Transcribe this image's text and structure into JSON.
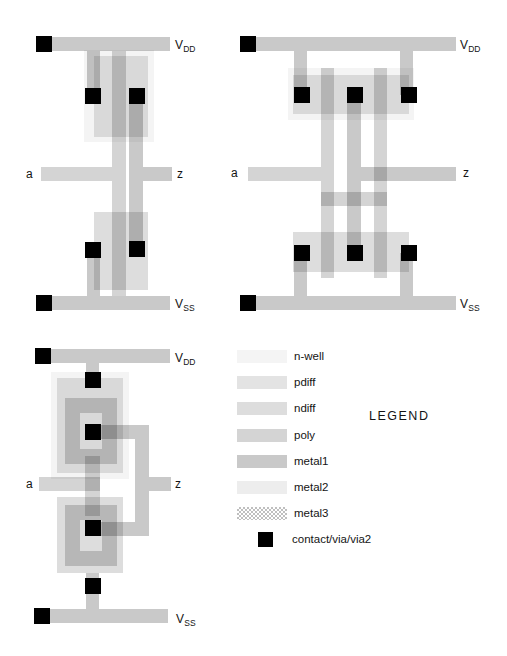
{
  "canvas": {
    "width": 507,
    "height": 656,
    "background": "#ffffff"
  },
  "layers": {
    "nwell": {
      "label": "n-well",
      "color": "rgba(0,0,0,0.045)"
    },
    "pdiff": {
      "label": "pdiff",
      "color": "rgba(0,0,0,0.11)"
    },
    "ndiff": {
      "label": "ndiff",
      "color": "rgba(0,0,0,0.135)"
    },
    "poly": {
      "label": "poly",
      "color": "rgba(0,0,0,0.17)"
    },
    "metal1": {
      "label": "metal1",
      "color": "rgba(0,0,0,0.21)"
    },
    "metal2": {
      "label": "metal2",
      "color": "rgba(0,0,0,0.07)"
    },
    "metal3": {
      "label": "metal3",
      "color": "rgba(0,0,0,0.25)",
      "pattern": "checker"
    },
    "contact": {
      "label": "contact/via/via2",
      "color": "#000000"
    }
  },
  "legend": {
    "title": "LEGEND",
    "order": [
      "nwell",
      "pdiff",
      "ndiff",
      "poly",
      "metal1",
      "metal2",
      "metal3",
      "contact"
    ]
  },
  "diagrams": [
    {
      "name": "inverter-strip-layout",
      "labels": [
        {
          "text": "V",
          "sub": "DD",
          "x": 175,
          "y": 39
        },
        {
          "text": "a",
          "x": 26,
          "y": 168
        },
        {
          "text": "z",
          "x": 177,
          "y": 168
        },
        {
          "text": "V",
          "sub": "SS",
          "x": 175,
          "y": 298
        }
      ],
      "shapes": [
        {
          "name": "n-well-region",
          "layer": "nwell",
          "x": 84,
          "y": 50,
          "w": 70,
          "h": 92
        },
        {
          "name": "pdiff-region",
          "layer": "pdiff",
          "x": 94,
          "y": 56,
          "w": 54,
          "h": 81
        },
        {
          "name": "ndiff-region",
          "layer": "ndiff",
          "x": 94,
          "y": 212,
          "w": 54,
          "h": 78
        },
        {
          "name": "poly-gate-column",
          "layer": "poly",
          "x": 112,
          "y": 51,
          "w": 14,
          "h": 245
        },
        {
          "name": "input-a-poly-bar",
          "layer": "poly",
          "x": 41,
          "y": 167,
          "w": 71,
          "h": 14
        },
        {
          "name": "vdd-rail",
          "layer": "metal1",
          "x": 36,
          "y": 37,
          "w": 134,
          "h": 14
        },
        {
          "name": "vdd-source-stub",
          "layer": "metal1",
          "x": 87,
          "y": 51,
          "w": 13,
          "h": 44
        },
        {
          "name": "drain-metal-column",
          "layer": "metal1",
          "x": 129,
          "y": 95,
          "w": 14,
          "h": 154
        },
        {
          "name": "output-z-metal-bar",
          "layer": "metal1",
          "x": 143,
          "y": 167,
          "w": 29,
          "h": 14
        },
        {
          "name": "vss-source-stub",
          "layer": "metal1",
          "x": 87,
          "y": 250,
          "w": 13,
          "h": 46
        },
        {
          "name": "vss-rail",
          "layer": "metal1",
          "x": 36,
          "y": 296,
          "w": 134,
          "h": 14
        },
        {
          "name": "vdd-rail-contact",
          "layer": "contact",
          "x": 36,
          "y": 36,
          "w": 16,
          "h": 16
        },
        {
          "name": "pmos-source-contact",
          "layer": "contact",
          "x": 85,
          "y": 88,
          "w": 16,
          "h": 16
        },
        {
          "name": "pmos-drain-contact",
          "layer": "contact",
          "x": 129,
          "y": 88,
          "w": 16,
          "h": 16
        },
        {
          "name": "nmos-source-contact",
          "layer": "contact",
          "x": 85,
          "y": 242,
          "w": 16,
          "h": 16
        },
        {
          "name": "nmos-drain-contact",
          "layer": "contact",
          "x": 129,
          "y": 241,
          "w": 16,
          "h": 16
        },
        {
          "name": "vss-rail-contact",
          "layer": "contact",
          "x": 36,
          "y": 295,
          "w": 16,
          "h": 16
        }
      ]
    },
    {
      "name": "inverter-two-finger-layout",
      "labels": [
        {
          "text": "V",
          "sub": "DD",
          "x": 460,
          "y": 39
        },
        {
          "text": "a",
          "x": 231,
          "y": 167
        },
        {
          "text": "z",
          "x": 463,
          "y": 167
        },
        {
          "text": "V",
          "sub": "SS",
          "x": 460,
          "y": 298
        }
      ],
      "shapes": [
        {
          "name": "n-well-region",
          "layer": "nwell",
          "x": 288,
          "y": 68,
          "w": 126,
          "h": 52
        },
        {
          "name": "pdiff-band",
          "layer": "pdiff",
          "x": 293,
          "y": 75,
          "w": 116,
          "h": 39
        },
        {
          "name": "ndiff-band",
          "layer": "ndiff",
          "x": 293,
          "y": 232,
          "w": 116,
          "h": 40
        },
        {
          "name": "poly-gate-column-left",
          "layer": "poly",
          "x": 321,
          "y": 68,
          "w": 13,
          "h": 210
        },
        {
          "name": "poly-gate-column-right",
          "layer": "poly",
          "x": 374,
          "y": 68,
          "w": 13,
          "h": 210
        },
        {
          "name": "poly-gate-link",
          "layer": "poly",
          "x": 321,
          "y": 192,
          "w": 66,
          "h": 14
        },
        {
          "name": "input-a-poly-bar",
          "layer": "poly",
          "x": 248,
          "y": 167,
          "w": 73,
          "h": 14
        },
        {
          "name": "vdd-rail",
          "layer": "metal1",
          "x": 241,
          "y": 37,
          "w": 215,
          "h": 14
        },
        {
          "name": "vdd-stub-left",
          "layer": "metal1",
          "x": 294,
          "y": 51,
          "w": 13,
          "h": 44
        },
        {
          "name": "vdd-stub-right",
          "layer": "metal1",
          "x": 400,
          "y": 51,
          "w": 13,
          "h": 44
        },
        {
          "name": "drain-metal-column",
          "layer": "metal1",
          "x": 347,
          "y": 95,
          "w": 14,
          "h": 159
        },
        {
          "name": "output-z-metal-bar",
          "layer": "metal1",
          "x": 361,
          "y": 167,
          "w": 95,
          "h": 14
        },
        {
          "name": "vss-stub-left",
          "layer": "metal1",
          "x": 294,
          "y": 253,
          "w": 13,
          "h": 43
        },
        {
          "name": "vss-stub-right",
          "layer": "metal1",
          "x": 400,
          "y": 253,
          "w": 13,
          "h": 43
        },
        {
          "name": "vss-rail",
          "layer": "metal1",
          "x": 241,
          "y": 296,
          "w": 215,
          "h": 14
        },
        {
          "name": "vdd-rail-contact",
          "layer": "contact",
          "x": 240,
          "y": 36,
          "w": 16,
          "h": 16
        },
        {
          "name": "pmos-source-contact-left",
          "layer": "contact",
          "x": 294,
          "y": 87,
          "w": 16,
          "h": 16
        },
        {
          "name": "pmos-drain-contact",
          "layer": "contact",
          "x": 347,
          "y": 87,
          "w": 16,
          "h": 16
        },
        {
          "name": "pmos-source-contact-right",
          "layer": "contact",
          "x": 401,
          "y": 87,
          "w": 16,
          "h": 16
        },
        {
          "name": "nmos-source-contact-left",
          "layer": "contact",
          "x": 294,
          "y": 245,
          "w": 16,
          "h": 16
        },
        {
          "name": "nmos-drain-contact",
          "layer": "contact",
          "x": 347,
          "y": 245,
          "w": 16,
          "h": 16
        },
        {
          "name": "nmos-source-contact-right",
          "layer": "contact",
          "x": 401,
          "y": 245,
          "w": 16,
          "h": 16
        },
        {
          "name": "vss-rail-contact",
          "layer": "contact",
          "x": 240,
          "y": 295,
          "w": 16,
          "h": 16
        }
      ]
    },
    {
      "name": "inverter-annular-layout",
      "labels": [
        {
          "text": "V",
          "sub": "DD",
          "x": 175,
          "y": 352
        },
        {
          "text": "a",
          "x": 26,
          "y": 478
        },
        {
          "text": "z",
          "x": 175,
          "y": 478
        },
        {
          "text": "V",
          "sub": "SS",
          "x": 176,
          "y": 613
        }
      ],
      "shapes": [
        {
          "name": "n-well-region",
          "layer": "nwell",
          "x": 51,
          "y": 372,
          "w": 78,
          "h": 107
        },
        {
          "name": "pdiff-region",
          "layer": "pdiff",
          "x": 57,
          "y": 378,
          "w": 66,
          "h": 95
        },
        {
          "name": "ndiff-region",
          "layer": "ndiff",
          "x": 57,
          "y": 497,
          "w": 66,
          "h": 76
        },
        {
          "name": "pmos-poly-gate-ring",
          "layer": "poly",
          "x": 65,
          "y": 398,
          "w": 52,
          "h": 66,
          "t": 15
        },
        {
          "name": "nmos-poly-gate-ring",
          "layer": "poly",
          "x": 65,
          "y": 505,
          "w": 52,
          "h": 61,
          "t": 15
        },
        {
          "name": "poly-gate-connector",
          "layer": "poly",
          "x": 85,
          "y": 456,
          "w": 15,
          "h": 60
        },
        {
          "name": "input-a-poly-bar",
          "layer": "poly",
          "x": 39,
          "y": 477,
          "w": 61,
          "h": 14
        },
        {
          "name": "vdd-rail",
          "layer": "metal1",
          "x": 35,
          "y": 349,
          "w": 135,
          "h": 14
        },
        {
          "name": "vdd-stub",
          "layer": "metal1",
          "x": 86,
          "y": 363,
          "w": 13,
          "h": 18
        },
        {
          "name": "drain-wire-top",
          "layer": "metal1",
          "x": 85,
          "y": 425,
          "w": 50,
          "h": 14
        },
        {
          "name": "drain-wire-vertical",
          "layer": "metal1",
          "x": 135,
          "y": 425,
          "w": 14,
          "h": 111
        },
        {
          "name": "drain-wire-bottom",
          "layer": "metal1",
          "x": 85,
          "y": 522,
          "w": 50,
          "h": 14
        },
        {
          "name": "output-z-metal-bar",
          "layer": "metal1",
          "x": 149,
          "y": 477,
          "w": 22,
          "h": 14
        },
        {
          "name": "vss-stub",
          "layer": "metal1",
          "x": 86,
          "y": 573,
          "w": 13,
          "h": 36
        },
        {
          "name": "vss-rail",
          "layer": "metal1",
          "x": 35,
          "y": 609,
          "w": 133,
          "h": 14
        },
        {
          "name": "vdd-rail-contact",
          "layer": "contact",
          "x": 35,
          "y": 348,
          "w": 16,
          "h": 16
        },
        {
          "name": "pmos-source-contact",
          "layer": "contact",
          "x": 85,
          "y": 372,
          "w": 16,
          "h": 16
        },
        {
          "name": "pmos-drain-contact",
          "layer": "contact",
          "x": 85,
          "y": 424,
          "w": 16,
          "h": 16
        },
        {
          "name": "nmos-drain-contact",
          "layer": "contact",
          "x": 85,
          "y": 520,
          "w": 16,
          "h": 16
        },
        {
          "name": "nmos-source-contact",
          "layer": "contact",
          "x": 85,
          "y": 578,
          "w": 16,
          "h": 16
        },
        {
          "name": "vss-rail-contact",
          "layer": "contact",
          "x": 34,
          "y": 608,
          "w": 16,
          "h": 16
        }
      ]
    }
  ],
  "legend_layout": {
    "swatch_x": 237,
    "swatch_w": 50,
    "swatch_h": 13,
    "first_y": 350,
    "pitch": 26.2,
    "label_x": 294,
    "contact_swatch": {
      "x": 258,
      "y": 532,
      "w": 15,
      "h": 15
    },
    "contact_label_x": 292,
    "title_x": 369,
    "title_y": 409
  }
}
